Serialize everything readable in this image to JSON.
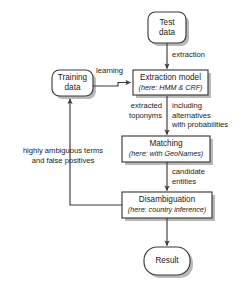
{
  "diagram": {
    "style": {
      "stroke": "#3b3b3b",
      "fill": "#ffffff",
      "shadow": "#b8b8b8",
      "text": "#1a1a1a"
    },
    "nodes": [
      {
        "id": "test-data",
        "shape": "rounded-rectangle",
        "line1": "Test",
        "line2": "data"
      },
      {
        "id": "training-data",
        "shape": "rounded-rectangle",
        "line1": "Training",
        "line2": "data"
      },
      {
        "id": "extraction-model",
        "shape": "rectangle",
        "line1": "Extraction model",
        "line2": "(here: HMM & CRF)"
      },
      {
        "id": "matching",
        "shape": "rectangle",
        "line1": "Matching",
        "line2": "(here: with GeoNames)"
      },
      {
        "id": "disambiguation",
        "shape": "rectangle",
        "line1": "Disambiguation",
        "line2": "(here: country inference)"
      },
      {
        "id": "result",
        "shape": "rounded-rectangle",
        "line1": "Result",
        "line2": ""
      }
    ],
    "edges": [
      {
        "id": "test-to-extraction",
        "from": "test-data",
        "to": "extraction-model",
        "label": "extraction"
      },
      {
        "id": "training-to-extraction",
        "from": "training-data",
        "to": "extraction-model",
        "label": "learning"
      },
      {
        "id": "extraction-to-matching",
        "from": "extraction-model",
        "to": "matching",
        "label_left_line1": "extracted",
        "label_left_line2": "toponyms",
        "label_right_line1": "including",
        "label_right_line2": "alternatives",
        "label_right_line3": "with probabilities"
      },
      {
        "id": "matching-to-disambiguation",
        "from": "matching",
        "to": "disambiguation",
        "label_line1": "candidate",
        "label_line2": "entities"
      },
      {
        "id": "disambiguation-to-training",
        "from": "disambiguation",
        "to": "training-data",
        "label_line1": "highly ambiguous terms",
        "label_line2": "and false positives"
      },
      {
        "id": "disambiguation-to-result",
        "from": "disambiguation",
        "to": "result",
        "label": ""
      }
    ]
  }
}
